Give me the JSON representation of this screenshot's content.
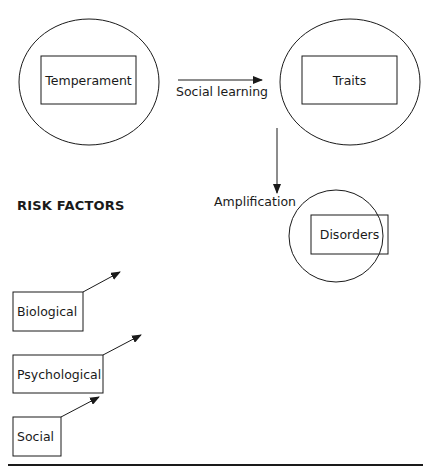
{
  "diagram": {
    "nodes": {
      "temperament": {
        "label": "Temperament"
      },
      "traits": {
        "label": "Traits"
      },
      "disorders": {
        "label": "Disorders"
      }
    },
    "edges": {
      "social_learning": {
        "from": "Temperament",
        "to": "Traits",
        "label": "Social learning"
      },
      "amplification": {
        "from": "Traits",
        "to": "Disorders",
        "label": "Amplification"
      }
    },
    "risk_factors": {
      "heading": "RISK FACTORS",
      "items": [
        {
          "label": "Biological"
        },
        {
          "label": "Psychological"
        },
        {
          "label": "Social"
        }
      ]
    },
    "colors": {
      "stroke": "#1a1a1a",
      "background": "#ffffff"
    }
  }
}
